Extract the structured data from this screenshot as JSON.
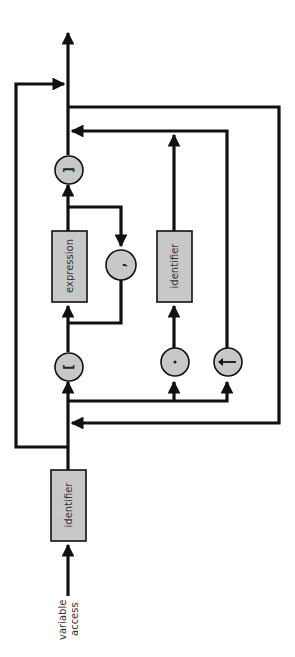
{
  "diagram": {
    "title": "variable access",
    "orientation": "rotated-90-ccw (reads bottom to top)",
    "entry_label_line1": "variable",
    "entry_label_line2": "access",
    "nonterminals": {
      "entry_identifier": "identifier",
      "expression": "expression",
      "field_identifier": "identifier"
    },
    "terminals": {
      "open_bracket": "[",
      "comma": ",",
      "close_bracket": "]",
      "dot": ".",
      "pointer": "↑"
    },
    "colors": {
      "stroke": "#111111",
      "fill": "#c8c8c8",
      "background": "#ffffff"
    }
  }
}
